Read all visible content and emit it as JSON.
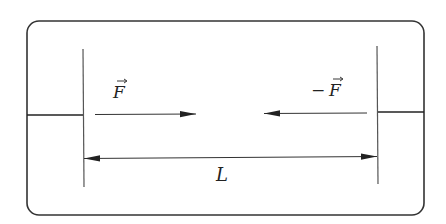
{
  "diagram": {
    "colors": {
      "stroke": "#333333",
      "plate": "#555555",
      "background": "#ffffff"
    },
    "labels": {
      "force_left": "F",
      "force_right_sign": "−",
      "force_right": "F",
      "distance": "L"
    },
    "elements": {
      "enclosure": {
        "x": 27,
        "y": 21,
        "width": 397,
        "height": 194,
        "radius": 12
      },
      "left_plate": {
        "x": 83,
        "y1": 49,
        "y2": 187
      },
      "right_plate": {
        "x": 377,
        "y1": 46,
        "y2": 184
      },
      "left_wire": {
        "x1": 27,
        "x2": 83,
        "y": 115
      },
      "right_wire": {
        "x1": 377,
        "x2": 424,
        "y": 112
      },
      "force_arrow_left": {
        "x1": 95,
        "x2": 196,
        "y": 114,
        "direction": "right"
      },
      "force_arrow_right": {
        "x1": 367,
        "x2": 264,
        "y": 113,
        "direction": "left"
      },
      "distance_arrow": {
        "x1": 83,
        "x2": 377,
        "y": 158,
        "direction": "both"
      }
    }
  }
}
